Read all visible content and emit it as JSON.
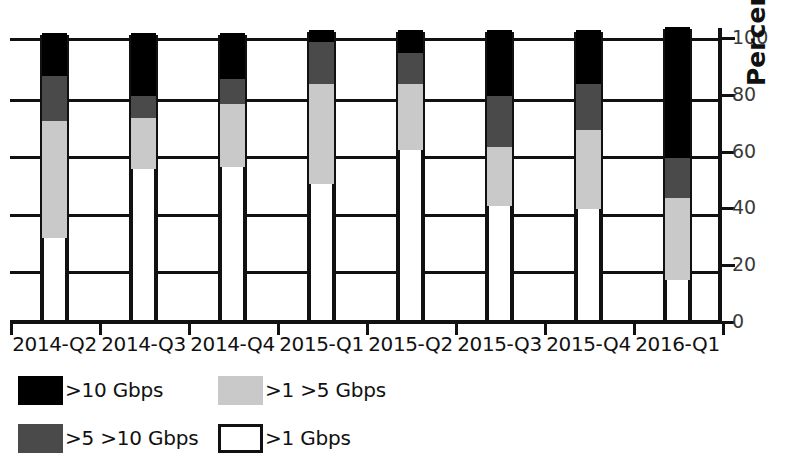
{
  "chart_data": {
    "type": "bar",
    "subtype": "stacked-bar-100",
    "title": "",
    "xlabel": "",
    "ylabel": "Percent of Attacks",
    "ylim": [
      0,
      100
    ],
    "yticks": [
      0,
      20,
      40,
      60,
      80,
      100
    ],
    "grid": true,
    "legend_position": "below-left",
    "categories": [
      "2014-Q2",
      "2014-Q3",
      "2014-Q4",
      "2015-Q1",
      "2015-Q2",
      "2015-Q3",
      "2015-Q4",
      "2016-Q1"
    ],
    "series": [
      {
        "name": ">1 Gbps",
        "color": "#ffffff",
        "values": [
          29,
          53,
          54,
          48,
          60,
          40,
          39,
          14
        ]
      },
      {
        "name": ">1  >5 Gbps",
        "color": "#c9c9c9",
        "values": [
          41,
          18,
          22,
          35,
          23,
          21,
          28,
          29
        ]
      },
      {
        "name": ">5  >10 Gbps",
        "color": "#4a4a4a",
        "values": [
          16,
          8,
          9,
          15,
          11,
          18,
          16,
          14
        ]
      },
      {
        "name": ">10 Gbps",
        "color": "#000000",
        "values": [
          15,
          22,
          16,
          4,
          8,
          23,
          19,
          46
        ]
      }
    ],
    "cumulative_tops": {
      "white": [
        29,
        53,
        54,
        48,
        60,
        40,
        39,
        14
      ],
      "light": [
        70,
        71,
        76,
        83,
        83,
        61,
        67,
        43
      ],
      "dark": [
        86,
        79,
        85,
        98,
        94,
        79,
        83,
        57
      ],
      "black": [
        101,
        101,
        101,
        102,
        102,
        102,
        102,
        103
      ]
    }
  },
  "axis": {
    "y_tick_labels": [
      "0",
      "20",
      "40",
      "60",
      "80",
      "100"
    ],
    "y_title": "Percent of Attacks"
  },
  "legend": {
    "items": [
      {
        "label": ">10 Gbps",
        "swatch": "black"
      },
      {
        "label": ">1  >5 Gbps",
        "swatch": "light"
      },
      {
        "label": ">5  >10 Gbps",
        "swatch": "dark"
      },
      {
        "label": ">1 Gbps",
        "swatch": "white"
      }
    ]
  }
}
